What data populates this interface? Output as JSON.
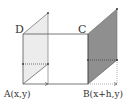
{
  "diagram": {
    "labels": {
      "A": "A(x,y)",
      "B": "B(x+h,y)",
      "C": "C",
      "D": "D"
    },
    "colors": {
      "line": "#555555",
      "left_fill": "#ebebeb",
      "right_fill": "#8c8c8c",
      "dotted": "#555555",
      "background": "#ffffff"
    },
    "points": {
      "A": [
        23,
        84
      ],
      "D": [
        23,
        34
      ],
      "C": [
        88,
        34
      ],
      "B": [
        88,
        84
      ],
      "left_back_top": [
        48,
        13
      ],
      "left_back_bottom": [
        48,
        64
      ],
      "right_back_top": [
        117,
        9
      ],
      "right_back_bottom": [
        117,
        60
      ]
    }
  }
}
